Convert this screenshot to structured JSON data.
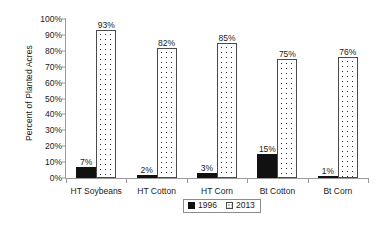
{
  "chart_data": {
    "type": "bar",
    "title": "",
    "xlabel": "",
    "ylabel": "Percent of Planted Acres",
    "ylim": [
      0,
      100
    ],
    "ytick_labels": [
      "0%",
      "10%",
      "20%",
      "30%",
      "40%",
      "50%",
      "60%",
      "70%",
      "80%",
      "90%",
      "100%"
    ],
    "ytick_values": [
      0,
      10,
      20,
      30,
      40,
      50,
      60,
      70,
      80,
      90,
      100
    ],
    "grid": false,
    "legend_position": "bottom-center",
    "categories": [
      "HT Soybeans",
      "HT Cotton",
      "HT Corn",
      "Bt Cotton",
      "Bt Corn"
    ],
    "series": [
      {
        "name": "1996",
        "values": [
          7,
          2,
          3,
          15,
          1
        ],
        "labels": [
          "7%",
          "2%",
          "3%",
          "15%",
          "1%"
        ],
        "color": "#111111",
        "fill": "solid-black"
      },
      {
        "name": "2013",
        "values": [
          93,
          82,
          85,
          75,
          76
        ],
        "labels": [
          "93%",
          "82%",
          "85%",
          "75%",
          "76%"
        ],
        "color": "#ffffff",
        "fill": "dotted-pattern"
      }
    ]
  },
  "legend": {
    "items": [
      {
        "label": "1996",
        "swatch": "solid-black-square"
      },
      {
        "label": "2013",
        "swatch": "dotted-square"
      }
    ]
  }
}
